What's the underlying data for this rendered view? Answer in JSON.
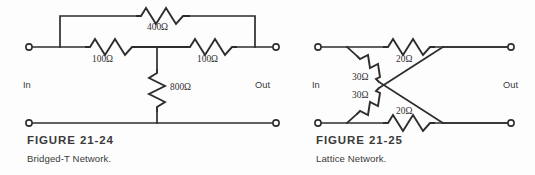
{
  "page": {
    "background_color": "#fdfdfd",
    "ink_color": "#2d2d2d"
  },
  "figures": [
    {
      "id": "figure-21-24",
      "caption_title": "FIGURE 21-24",
      "caption_subtitle": "Bridged-T Network.",
      "port_in_label": "In",
      "port_out_label": "Out",
      "components": [
        {
          "name": "bridge-resistor",
          "value": "400Ω"
        },
        {
          "name": "series-resistor-left",
          "value": "100Ω"
        },
        {
          "name": "series-resistor-right",
          "value": "100Ω"
        },
        {
          "name": "shunt-resistor",
          "value": "800Ω"
        }
      ]
    },
    {
      "id": "figure-21-25",
      "caption_title": "FIGURE 21-25",
      "caption_subtitle": "Lattice Network.",
      "port_in_label": "In",
      "port_out_label": "Out",
      "components": [
        {
          "name": "series-resistor-top",
          "value": "20Ω"
        },
        {
          "name": "diagonal-resistor-upper",
          "value": "30Ω"
        },
        {
          "name": "diagonal-resistor-lower",
          "value": "30Ω"
        },
        {
          "name": "series-resistor-bottom",
          "value": "20Ω"
        }
      ]
    }
  ]
}
